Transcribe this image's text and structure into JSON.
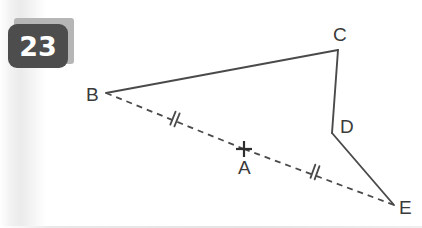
{
  "problem": {
    "number_label": "23"
  },
  "figure": {
    "points": {
      "A": {
        "label": "A",
        "x": 244,
        "y": 149,
        "marker": "cross-marker",
        "label_x": 238,
        "label_y": 158
      },
      "B": {
        "label": "B",
        "x": 106,
        "y": 93,
        "marker": "none",
        "label_x": 86,
        "label_y": 85
      },
      "C": {
        "label": "C",
        "x": 338,
        "y": 50,
        "marker": "none",
        "label_x": 333,
        "label_y": 25
      },
      "D": {
        "label": "D",
        "x": 332,
        "y": 133,
        "marker": "none",
        "label_x": 340,
        "label_y": 117
      },
      "E": {
        "label": "E",
        "x": 394,
        "y": 205,
        "marker": "none",
        "label_x": 399,
        "label_y": 198
      }
    },
    "segments": [
      {
        "name": "segment-bc",
        "from": "B",
        "to": "C",
        "style": "solid",
        "ticks": 0
      },
      {
        "name": "segment-cd",
        "from": "C",
        "to": "D",
        "style": "solid",
        "ticks": 0
      },
      {
        "name": "segment-de",
        "from": "D",
        "to": "E",
        "style": "solid",
        "ticks": 0
      },
      {
        "name": "segment-ba",
        "from": "B",
        "to": "A",
        "style": "dashed",
        "ticks": 2,
        "tick_x": 175,
        "tick_y": 119
      },
      {
        "name": "segment-ae",
        "from": "A",
        "to": "E",
        "style": "dashed",
        "ticks": 2,
        "tick_x": 315,
        "tick_y": 172
      }
    ],
    "colors": {
      "stroke": "#4a4a4a",
      "label": "#3a3a3a",
      "badge_fill": "#4d4d4d",
      "badge_shadow": "#b6b6b6",
      "badge_text": "#ffffff",
      "background": "#ffffff"
    }
  }
}
